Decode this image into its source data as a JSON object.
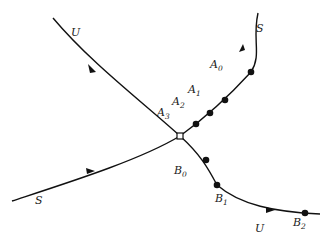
{
  "diagram": {
    "fixed_point": {
      "x": 180,
      "y": 136,
      "marker": "open-square"
    },
    "curves": [
      {
        "id": "unstable",
        "label": "U",
        "label2": "U",
        "color": "#111111"
      },
      {
        "id": "stable",
        "label": "S",
        "label2": "S",
        "color": "#111111"
      }
    ],
    "points": {
      "A0": {
        "base": "A",
        "sub": "0"
      },
      "A1": {
        "base": "A",
        "sub": "1"
      },
      "A2": {
        "base": "A",
        "sub": "2"
      },
      "A3": {
        "base": "A",
        "sub": "3"
      },
      "B0": {
        "base": "B",
        "sub": "0"
      },
      "B1": {
        "base": "B",
        "sub": "1"
      },
      "B2": {
        "base": "B",
        "sub": "2"
      }
    }
  }
}
